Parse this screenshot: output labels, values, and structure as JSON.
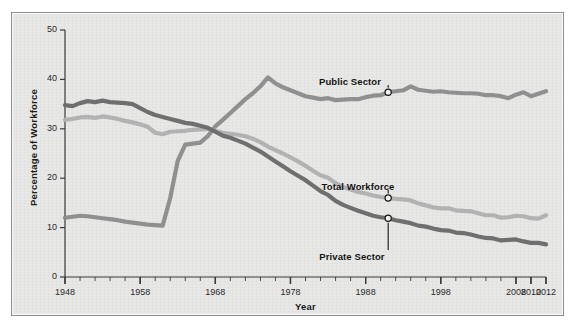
{
  "chart_data": {
    "type": "line",
    "title": "",
    "xlabel": "Year",
    "ylabel": "Percentage of Workforce",
    "xlim": [
      1948,
      2012
    ],
    "ylim": [
      0,
      50
    ],
    "ytick_labels": [
      "0",
      "10",
      "20",
      "30",
      "40",
      "50"
    ],
    "ytick_values": [
      0,
      10,
      20,
      30,
      40,
      50
    ],
    "xtick_labels": [
      "1948",
      "1958",
      "1968",
      "1978",
      "1988",
      "1998",
      "2008",
      "2010",
      "2012"
    ],
    "xtick_values": [
      1948,
      1958,
      1968,
      1978,
      1988,
      1998,
      2008,
      2010,
      2012
    ],
    "minor_tick_interval": 2,
    "grid": false,
    "legend_position": "inline-annotations",
    "colors": {
      "public_sector": "#8e8e8e",
      "total_workforce": "#b2b2b2",
      "private_sector": "#6b6b6b",
      "background": "#e8e8e6",
      "axis": "#3a3a3a",
      "text": "#1b1b1b"
    },
    "series": [
      {
        "name": "Public Sector",
        "color": "#8e8e8e",
        "label_anchor_year": 1991,
        "label_anchor_value": 37.4,
        "x": [
          1948,
          1949,
          1950,
          1951,
          1952,
          1953,
          1954,
          1955,
          1956,
          1957,
          1958,
          1959,
          1960,
          1961,
          1962,
          1963,
          1964,
          1965,
          1966,
          1967,
          1968,
          1969,
          1970,
          1971,
          1972,
          1973,
          1974,
          1975,
          1976,
          1977,
          1978,
          1979,
          1980,
          1981,
          1982,
          1983,
          1984,
          1985,
          1986,
          1987,
          1988,
          1989,
          1990,
          1991,
          1992,
          1993,
          1994,
          1995,
          1996,
          1997,
          1998,
          1999,
          2000,
          2001,
          2002,
          2003,
          2004,
          2005,
          2006,
          2007,
          2008,
          2009,
          2010,
          2011,
          2012
        ],
        "y": [
          12.0,
          12.2,
          12.4,
          12.3,
          12.1,
          11.9,
          11.7,
          11.5,
          11.2,
          11.0,
          10.8,
          10.6,
          10.5,
          10.4,
          16.0,
          23.5,
          26.8,
          27.0,
          27.2,
          28.5,
          30.5,
          31.8,
          33.2,
          34.6,
          36.0,
          37.2,
          38.6,
          40.4,
          39.2,
          38.4,
          37.8,
          37.2,
          36.6,
          36.3,
          36.0,
          36.2,
          35.8,
          35.9,
          36.0,
          36.0,
          36.4,
          36.7,
          36.8,
          37.4,
          37.6,
          37.8,
          38.6,
          37.9,
          37.7,
          37.5,
          37.6,
          37.4,
          37.3,
          37.2,
          37.2,
          37.1,
          36.8,
          36.8,
          36.6,
          36.2,
          36.9,
          37.4,
          36.6,
          37.1,
          37.6
        ],
        "y_2010_peak": 38.1
      },
      {
        "name": "Total Workforce",
        "color": "#b2b2b2",
        "label_anchor_year": 1991,
        "label_anchor_value": 16.0,
        "x": [
          1948,
          1949,
          1950,
          1951,
          1952,
          1953,
          1954,
          1955,
          1956,
          1957,
          1958,
          1959,
          1960,
          1961,
          1962,
          1963,
          1964,
          1965,
          1966,
          1967,
          1968,
          1969,
          1970,
          1971,
          1972,
          1973,
          1974,
          1975,
          1976,
          1977,
          1978,
          1979,
          1980,
          1981,
          1982,
          1983,
          1984,
          1985,
          1986,
          1987,
          1988,
          1989,
          1990,
          1991,
          1992,
          1993,
          1994,
          1995,
          1996,
          1997,
          1998,
          1999,
          2000,
          2001,
          2002,
          2003,
          2004,
          2005,
          2006,
          2007,
          2008,
          2009,
          2010,
          2011,
          2012
        ],
        "y": [
          31.8,
          32.0,
          32.3,
          32.4,
          32.2,
          32.5,
          32.3,
          32.0,
          31.6,
          31.3,
          30.9,
          30.4,
          29.2,
          28.9,
          29.4,
          29.5,
          29.6,
          29.8,
          29.9,
          30.0,
          29.6,
          29.2,
          29.0,
          28.8,
          28.5,
          28.0,
          27.3,
          26.4,
          25.7,
          25.0,
          24.2,
          23.4,
          22.5,
          21.5,
          20.6,
          20.1,
          19.0,
          18.2,
          17.7,
          17.2,
          16.9,
          16.5,
          16.2,
          16.0,
          15.8,
          15.7,
          15.5,
          14.9,
          14.5,
          14.1,
          13.9,
          13.9,
          13.5,
          13.4,
          13.3,
          12.9,
          12.5,
          12.5,
          12.0,
          12.1,
          12.4,
          12.3,
          11.9,
          11.8,
          12.5
        ]
      },
      {
        "name": "Private Sector",
        "color": "#6b6b6b",
        "label_anchor_year": 1991,
        "label_anchor_value": 11.9,
        "x": [
          1948,
          1949,
          1950,
          1951,
          1952,
          1953,
          1954,
          1955,
          1956,
          1957,
          1958,
          1959,
          1960,
          1961,
          1962,
          1963,
          1964,
          1965,
          1966,
          1967,
          1968,
          1969,
          1970,
          1971,
          1972,
          1973,
          1974,
          1975,
          1976,
          1977,
          1978,
          1979,
          1980,
          1981,
          1982,
          1983,
          1984,
          1985,
          1986,
          1987,
          1988,
          1989,
          1990,
          1991,
          1992,
          1993,
          1994,
          1995,
          1996,
          1997,
          1998,
          1999,
          2000,
          2001,
          2002,
          2003,
          2004,
          2005,
          2006,
          2007,
          2008,
          2009,
          2010,
          2011,
          2012
        ],
        "y": [
          34.8,
          34.6,
          35.2,
          35.6,
          35.4,
          35.7,
          35.4,
          35.3,
          35.2,
          35.0,
          34.2,
          33.4,
          32.8,
          32.4,
          32.0,
          31.6,
          31.2,
          31.0,
          30.6,
          30.2,
          29.4,
          28.6,
          28.2,
          27.6,
          27.0,
          26.2,
          25.4,
          24.4,
          23.4,
          22.4,
          21.4,
          20.5,
          19.6,
          18.5,
          17.4,
          16.6,
          15.4,
          14.6,
          14.0,
          13.4,
          12.9,
          12.4,
          12.1,
          11.9,
          11.5,
          11.2,
          10.9,
          10.4,
          10.2,
          9.8,
          9.5,
          9.4,
          9.0,
          8.9,
          8.6,
          8.2,
          7.9,
          7.8,
          7.4,
          7.5,
          7.6,
          7.2,
          6.9,
          6.9,
          6.6
        ]
      }
    ]
  },
  "axes": {
    "y_title": "Percentage of Workforce",
    "x_title": "Year"
  },
  "annotations": [
    {
      "id": "public-sector",
      "label": "Public Sector"
    },
    {
      "id": "total-workforce",
      "label": "Total Workforce"
    },
    {
      "id": "private-sector",
      "label": "Private Sector"
    }
  ]
}
